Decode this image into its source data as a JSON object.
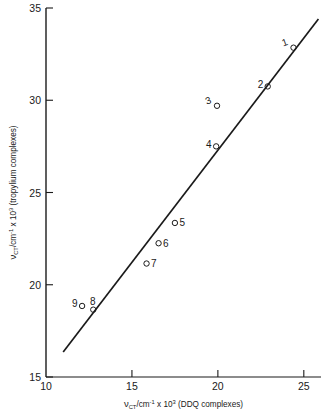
{
  "chart_data": {
    "type": "scatter",
    "title": "",
    "xlabel": "ν CT /cm⁻¹ x 10³ (DDQ complexes)",
    "xlabel_parts": {
      "nu": "ν",
      "sub": "CT",
      "mid": "/cm",
      "sup1": "-1",
      "times": " x 10",
      "sup2": "3",
      "tail": " (DDQ complexes)"
    },
    "ylabel": "ν CT /cm⁻¹ x 10³ (tropylium complexes)",
    "ylabel_parts": {
      "nu": "ν",
      "sub": "CT",
      "mid": "/cm",
      "sup1": "-1",
      "times": " x 10",
      "sup2": "3",
      "tail": " (tropylium complexes)"
    },
    "xlim": [
      10,
      26
    ],
    "ylim": [
      15,
      35
    ],
    "xticks": [
      10,
      15,
      20,
      25
    ],
    "xtick_labels": [
      "10",
      "15",
      "20",
      "25"
    ],
    "yticks": [
      15,
      20,
      25,
      30,
      35
    ],
    "ytick_labels": [
      "15",
      "20",
      "25",
      "30",
      "35"
    ],
    "grid": false,
    "legend": "none",
    "marker": "open-circle",
    "points": [
      {
        "label": "1",
        "x": 24.4,
        "y": 32.85,
        "label_pos": "upper-left"
      },
      {
        "label": "2",
        "x": 22.9,
        "y": 30.75,
        "label_pos": "left"
      },
      {
        "label": "3",
        "x": 19.95,
        "y": 29.7,
        "label_pos": "upper-left"
      },
      {
        "label": "4",
        "x": 19.9,
        "y": 27.5,
        "label_pos": "left"
      },
      {
        "label": "5",
        "x": 17.5,
        "y": 23.35,
        "label_pos": "right"
      },
      {
        "label": "6",
        "x": 16.55,
        "y": 22.25,
        "label_pos": "right"
      },
      {
        "label": "7",
        "x": 15.85,
        "y": 21.15,
        "label_pos": "right"
      },
      {
        "label": "8",
        "x": 12.75,
        "y": 18.65,
        "label_pos": "above"
      },
      {
        "label": "9",
        "x": 12.1,
        "y": 18.85,
        "label_pos": "left"
      }
    ],
    "fit_line": {
      "x_start": 11.0,
      "y_start": 16.35,
      "x_end": 25.85,
      "y_end": 34.4,
      "slope": 1.215,
      "intercept": 2.98
    }
  }
}
